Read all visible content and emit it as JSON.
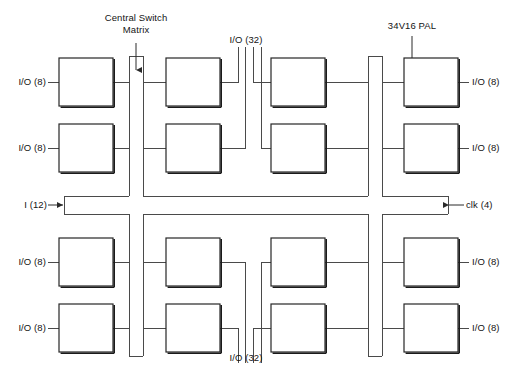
{
  "diagram": {
    "title_annotations": [
      {
        "id": "central-switch-matrix",
        "text_line1": "Central Switch",
        "text_line2": "Matrix"
      },
      {
        "id": "pal-part-number",
        "text": "34V16 PAL"
      }
    ],
    "bus_labels": {
      "io32_top": "I/O (32)",
      "io32_bottom": "I/O (32)",
      "input": "I (12)",
      "clock": "clk (4)"
    },
    "left_ports": [
      {
        "label": "I/O (8)"
      },
      {
        "label": "I/O (8)"
      },
      {
        "label": "I/O (8)"
      },
      {
        "label": "I/O (8)"
      }
    ],
    "right_ports": [
      {
        "label": "I/O (8)"
      },
      {
        "label": "I/O (8)"
      },
      {
        "label": "I/O (8)"
      },
      {
        "label": "I/O (8)"
      }
    ],
    "blocks": [
      {
        "row": 0,
        "col": 0,
        "name": "pal-block-r1c1"
      },
      {
        "row": 0,
        "col": 1,
        "name": "pal-block-r1c2"
      },
      {
        "row": 0,
        "col": 2,
        "name": "pal-block-r1c3"
      },
      {
        "row": 0,
        "col": 3,
        "name": "pal-block-r1c4"
      },
      {
        "row": 1,
        "col": 0,
        "name": "pal-block-r2c1"
      },
      {
        "row": 1,
        "col": 1,
        "name": "pal-block-r2c2"
      },
      {
        "row": 1,
        "col": 2,
        "name": "pal-block-r2c3"
      },
      {
        "row": 1,
        "col": 3,
        "name": "pal-block-r2c4"
      },
      {
        "row": 2,
        "col": 0,
        "name": "pal-block-r3c1"
      },
      {
        "row": 2,
        "col": 1,
        "name": "pal-block-r3c2"
      },
      {
        "row": 2,
        "col": 2,
        "name": "pal-block-r3c3"
      },
      {
        "row": 2,
        "col": 3,
        "name": "pal-block-r3c4"
      },
      {
        "row": 3,
        "col": 0,
        "name": "pal-block-r4c1"
      },
      {
        "row": 3,
        "col": 1,
        "name": "pal-block-r4c2"
      },
      {
        "row": 3,
        "col": 2,
        "name": "pal-block-r4c3"
      },
      {
        "row": 3,
        "col": 3,
        "name": "pal-block-r4c4"
      }
    ],
    "colors": {
      "line": "#3a3a3a",
      "block_edge": "#262626",
      "block_shadow": "#1a1a1a",
      "background": "#ffffff",
      "text": "#141414"
    }
  }
}
